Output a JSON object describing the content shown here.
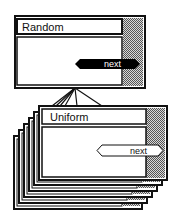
{
  "top_card": {
    "title": "Random",
    "button_label": "next",
    "button_style": "filled"
  },
  "stack": {
    "front_card": {
      "title": "Uniform",
      "button_label": "next",
      "button_style": "outline"
    },
    "card_count": 6
  },
  "connector": {
    "line_count": 6
  },
  "colors": {
    "border": "#111111",
    "shade": "#a8a8a8",
    "background": "#ffffff",
    "button_filled": "#000000"
  }
}
